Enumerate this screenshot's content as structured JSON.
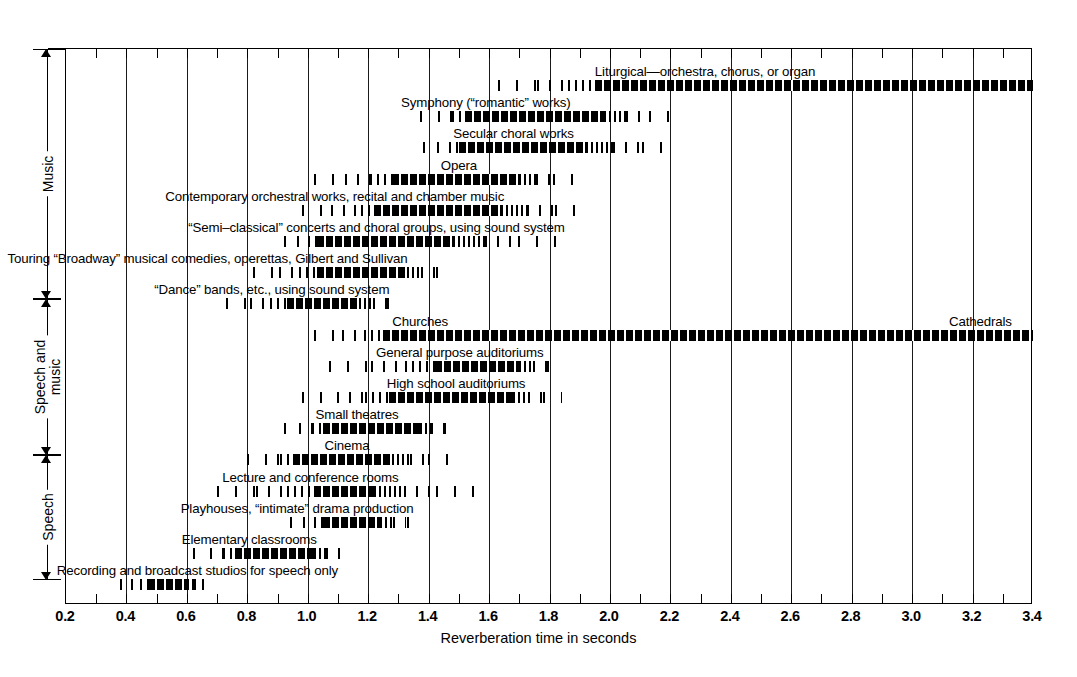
{
  "chart_data": {
    "type": "bar",
    "title": "",
    "xlabel": "Reverberation time in seconds",
    "ylabel": "",
    "xlim": [
      0.2,
      3.4
    ],
    "xticks": [
      0.2,
      0.4,
      0.6,
      0.8,
      1.0,
      1.2,
      1.4,
      1.6,
      1.8,
      2.0,
      2.2,
      2.4,
      2.6,
      2.8,
      3.0,
      3.2,
      3.4
    ],
    "xtick_labels": [
      "0.2",
      "0.4",
      "0.6",
      "0.8",
      "1.0",
      "1.2",
      "1.4",
      "1.6",
      "1.8",
      "2.0",
      "2.2",
      "2.4",
      "2.6",
      "2.8",
      "3.0",
      "3.2",
      "3.4"
    ],
    "minor_tick_step": 0.1,
    "grid": true,
    "legend": null,
    "orientation": "horizontal",
    "note": "Each bar is a fuzzy range: sparse ticks fade in, a dense core marks the preferred range, sparse ticks fade out.",
    "categories": [
      "Liturgical—orchestra, chorus, or organ",
      "Symphony (“romantic” works)",
      "Secular choral works",
      "Opera",
      "Contemporary orchestral works, recital and chamber music",
      "“Semi–classical” concerts and choral groups, using sound system",
      "Touring “Broadway” musical comedies, operettas, Gilbert and Sullivan",
      "“Dance” bands, etc., using sound system",
      "Churches … Cathedrals",
      "General purpose auditoriums",
      "High school auditoriums",
      "Small theatres",
      "Cinema",
      "Lecture and conference rooms",
      "Playhouses, “intimate” drama production",
      "Elementary classrooms",
      "Recording and broadcast studios for speech only"
    ],
    "bars": [
      {
        "name": "liturgical",
        "label": "Liturgical—orchestra, chorus, or organ",
        "fade_in": 1.63,
        "core_start": 1.95,
        "core_end": 3.4,
        "fade_out": 3.4,
        "label_x": 1.95,
        "label_align": "left",
        "group": "Music"
      },
      {
        "name": "symphony",
        "label": "Symphony (“romantic” works)",
        "fade_in": 1.37,
        "core_start": 1.52,
        "core_end": 1.98,
        "fade_out": 2.22,
        "label_x": 1.87,
        "label_align": "right",
        "group": "Music"
      },
      {
        "name": "secular-choral",
        "label": "Secular choral works",
        "fade_in": 1.38,
        "core_start": 1.5,
        "core_end": 1.92,
        "fade_out": 2.22,
        "label_x": 1.88,
        "label_align": "right",
        "group": "Music"
      },
      {
        "name": "opera",
        "label": "Opera",
        "fade_in": 1.02,
        "core_start": 1.28,
        "core_end": 1.7,
        "fade_out": 1.88,
        "label_x": 1.5,
        "label_align": "center",
        "group": "Music"
      },
      {
        "name": "contemporary-orchestral",
        "label": "Contemporary orchestral works, recital and chamber music",
        "fade_in": 0.98,
        "core_start": 1.22,
        "core_end": 1.64,
        "fade_out": 1.93,
        "label_x": 1.65,
        "label_align": "right",
        "group": "Music"
      },
      {
        "name": "semi-classical",
        "label": "“Semi–classical” concerts and choral groups, using sound system",
        "fade_in": 0.92,
        "core_start": 1.03,
        "core_end": 1.48,
        "fade_out": 1.83,
        "label_x": 1.85,
        "label_align": "right",
        "group": "Music"
      },
      {
        "name": "touring-broadway",
        "label": "Touring “Broadway” musical comedies, operettas, Gilbert and Sullivan",
        "fade_in": 0.82,
        "core_start": 1.03,
        "core_end": 1.33,
        "fade_out": 1.48,
        "label_x": 1.33,
        "label_align": "right",
        "group": "Music"
      },
      {
        "name": "dance-bands",
        "label": "“Dance” bands, etc., using sound system",
        "fade_in": 0.73,
        "core_start": 0.93,
        "core_end": 1.17,
        "fade_out": 1.32,
        "label_x": 1.27,
        "label_align": "right",
        "group": "Music"
      },
      {
        "name": "churches-cathedrals",
        "label": "Churches",
        "label2": "Cathedrals",
        "fade_in": 1.02,
        "core_start": 1.25,
        "core_end": 3.4,
        "fade_out": 3.4,
        "label_x": 1.28,
        "label_align": "left",
        "label2_x": 3.33,
        "group": "Speech and music"
      },
      {
        "name": "general-purpose-auditoriums",
        "label": "General purpose auditoriums",
        "fade_in": 1.07,
        "core_start": 1.42,
        "core_end": 1.7,
        "fade_out": 1.85,
        "label_x": 1.78,
        "label_align": "right",
        "group": "Speech and music"
      },
      {
        "name": "high-school-auditoriums",
        "label": "High school auditoriums",
        "fade_in": 0.98,
        "core_start": 1.27,
        "core_end": 1.68,
        "fade_out": 1.84,
        "label_x": 1.72,
        "label_align": "right",
        "group": "Speech and music"
      },
      {
        "name": "small-theatres",
        "label": "Small theatres",
        "fade_in": 0.92,
        "core_start": 1.05,
        "core_end": 1.37,
        "fade_out": 1.5,
        "label_x": 1.3,
        "label_align": "right",
        "group": "Speech and music"
      },
      {
        "name": "cinema",
        "label": "Cinema",
        "fade_in": 0.8,
        "core_start": 0.95,
        "core_end": 1.28,
        "fade_out": 1.47,
        "label_x": 1.13,
        "label_align": "center",
        "group": "Speech and music"
      },
      {
        "name": "lecture-conference-rooms",
        "label": "Lecture and conference rooms",
        "fade_in": 0.7,
        "core_start": 1.02,
        "core_end": 1.22,
        "fade_out": 1.55,
        "label_x": 1.3,
        "label_align": "right",
        "group": "Speech"
      },
      {
        "name": "playhouses",
        "label": "Playhouses, “intimate” drama production",
        "fade_in": 0.94,
        "core_start": 1.05,
        "core_end": 1.24,
        "fade_out": 1.38,
        "label_x": 1.35,
        "label_align": "right",
        "group": "Speech"
      },
      {
        "name": "elementary-classrooms",
        "label": "Elementary classrooms",
        "fade_in": 0.62,
        "core_start": 0.76,
        "core_end": 1.02,
        "fade_out": 1.15,
        "label_x": 1.03,
        "label_align": "right",
        "group": "Speech"
      },
      {
        "name": "recording-broadcast-studios",
        "label": "Recording and broadcast studios for speech only",
        "fade_in": 0.38,
        "core_start": 0.47,
        "core_end": 0.6,
        "fade_out": 0.68,
        "label_x": 1.1,
        "label_align": "right",
        "group": "Speech"
      }
    ],
    "category_groups": [
      {
        "name": "music",
        "label": "Music",
        "row_start": 0,
        "row_end": 7
      },
      {
        "name": "speech-and-music",
        "label": "Speech and\nmusic",
        "row_start": 8,
        "row_end": 12
      },
      {
        "name": "speech",
        "label": "Speech",
        "row_start": 13,
        "row_end": 16
      }
    ]
  }
}
